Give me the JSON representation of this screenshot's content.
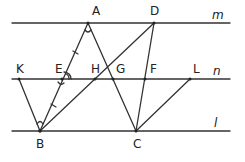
{
  "diagram": {
    "lines": {
      "m": {
        "label": "m",
        "y": 23,
        "x1": 12,
        "x2": 230
      },
      "n": {
        "label": "n",
        "y": 79,
        "x1": 12,
        "x2": 230
      },
      "l": {
        "label": "l",
        "y": 131,
        "x1": 12,
        "x2": 230
      }
    },
    "points": {
      "A": {
        "label": "A",
        "x": 88,
        "y": 23
      },
      "D": {
        "label": "D",
        "x": 154,
        "y": 23
      },
      "K": {
        "label": "K",
        "x": 19,
        "y": 79
      },
      "E": {
        "label": "E",
        "x": 62,
        "y": 79
      },
      "H": {
        "label": "H",
        "x": 95,
        "y": 79
      },
      "G": {
        "label": "G",
        "x": 113,
        "y": 79
      },
      "F": {
        "label": "F",
        "x": 145,
        "y": 79
      },
      "L": {
        "label": "L",
        "x": 190,
        "y": 79
      },
      "B": {
        "label": "B",
        "x": 40,
        "y": 131
      },
      "C": {
        "label": "C",
        "x": 136,
        "y": 131
      }
    },
    "segments": [
      "AB",
      "AC",
      "DB",
      "DC",
      "KB",
      "LC"
    ],
    "marks": [
      "angle at A",
      "angle at B",
      "angle at E (double arc)",
      "tick on AE",
      "tick on EB"
    ]
  }
}
